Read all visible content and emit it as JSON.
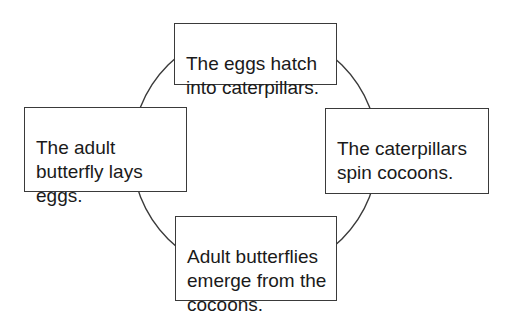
{
  "diagram": {
    "type": "cycle",
    "topic": "Butterfly life cycle",
    "colors": {
      "background": "#ffffff",
      "box_border": "#3a3a3a",
      "ring_stroke": "#3a3a3a",
      "text": "#1a1a1a"
    },
    "stages": {
      "top": {
        "position": "top",
        "text": "The eggs hatch\ninto caterpillars."
      },
      "right": {
        "position": "right",
        "text": "The caterpillars\nspin cocoons."
      },
      "bottom": {
        "position": "bottom",
        "text": "Adult butterflies\nemerge from the\ncocoons."
      },
      "left": {
        "position": "left",
        "text": "The adult\nbutterfly lays\neggs."
      }
    },
    "order": [
      "left",
      "top",
      "right",
      "bottom"
    ]
  }
}
